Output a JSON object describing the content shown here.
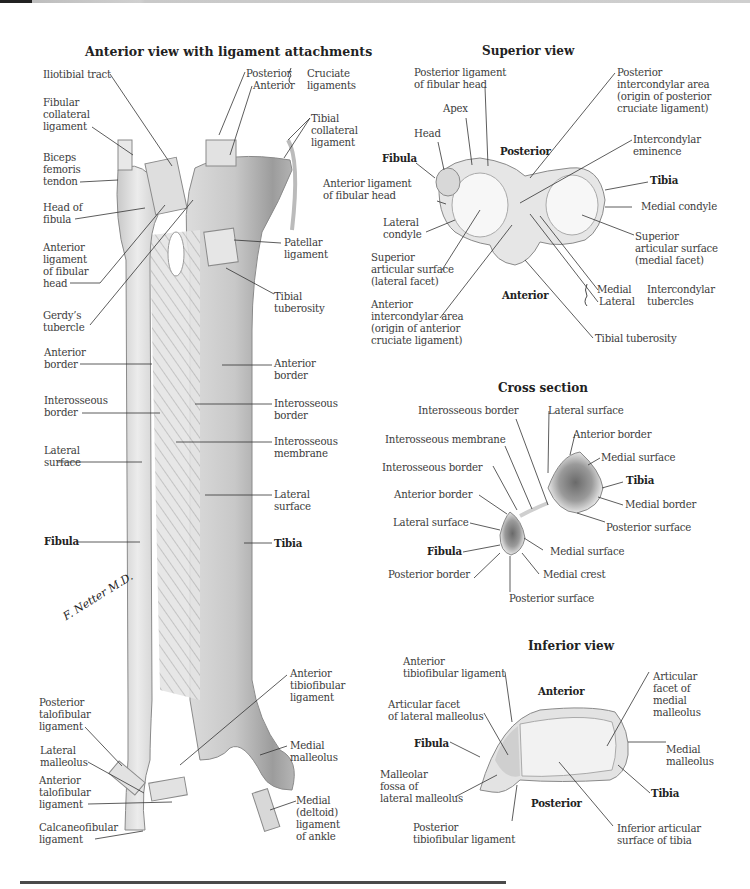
{
  "figure": {
    "signature": "F. Netter M.D.",
    "anterior_view": {
      "title": "Anterior view with ligament attachments",
      "labels": {
        "iliotibial_tract": "Iliotibial tract",
        "fibular_collateral_ligament": "Fibular\ncollateral\nligament",
        "biceps_femoris_tendon": "Biceps\nfemoris\ntendon",
        "head_of_fibula": "Head of\nfibula",
        "anterior_ligament_fibular_head": "Anterior\nligament\nof fibular\nhead",
        "gerdys_tubercle": "Gerdy’s\ntubercle",
        "fibula_anterior_border": "Anterior\nborder",
        "fibula_interosseous_border": "Interosseous\nborder",
        "fibula_lateral_surface": "Lateral\nsurface",
        "fibula": "Fibula",
        "posterior_talofibular_ligament": "Posterior\ntalofibular\nligament",
        "lateral_malleolus": "Lateral\nmalleolus",
        "anterior_talofibular_ligament": "Anterior\ntalofibular\nligament",
        "calcaneofibular_ligament": "Calcaneofibular\nligament",
        "cruciate_posterior": "Posterior",
        "cruciate_anterior": "Anterior",
        "cruciate_ligaments": "Cruciate\nligaments",
        "tibial_collateral_ligament": "Tibial\ncollateral\nligament",
        "patellar_ligament": "Patellar\nligament",
        "tibial_tuberosity": "Tibial\ntuberosity",
        "tibia_anterior_border": "Anterior\nborder",
        "tibia_interosseous_border": "Interosseous\nborder",
        "interosseous_membrane": "Interosseous\nmembrane",
        "tibia_lateral_surface": "Lateral\nsurface",
        "tibia": "Tibia",
        "anterior_tibiofibular_ligament": "Anterior\ntibiofibular\nligament",
        "medial_malleolus": "Medial\nmalleolus",
        "medial_deltoid_ligament": "Medial\n(deltoid)\nligament\nof ankle"
      }
    },
    "superior_view": {
      "title": "Superior view",
      "labels": {
        "posterior_ligament_fibular_head": "Posterior ligament\nof fibular head",
        "apex": "Apex",
        "head": "Head",
        "fibula": "Fibula",
        "anterior_ligament_fibular_head": "Anterior ligament\nof fibular head",
        "lateral_condyle": "Lateral\ncondyle",
        "superior_articular_lateral": "Superior\narticular surface\n(lateral facet)",
        "anterior_intercondylar_area": "Anterior\nintercondylar area\n(origin of anterior\ncruciate ligament)",
        "posterior": "Posterior",
        "anterior": "Anterior",
        "posterior_intercondylar_area": "Posterior\nintercondylar area\n(origin of posterior\ncruciate ligament)",
        "intercondylar_eminence": "Intercondylar\neminence",
        "tibia": "Tibia",
        "medial_condyle": "Medial condyle",
        "superior_articular_medial": "Superior\narticular surface\n(medial facet)",
        "tubercle_medial": "Medial",
        "tubercle_lateral": "Lateral",
        "intercondylar_tubercles": "Intercondylar\ntubercles",
        "tibial_tuberosity": "Tibial tuberosity"
      }
    },
    "cross_section": {
      "title": "Cross section",
      "labels": {
        "interosseous_border_tibia": "Interosseous border",
        "interosseous_membrane": "Interosseous membrane",
        "interosseous_border_fibula": "Interosseous border",
        "anterior_border_fibula": "Anterior border",
        "lateral_surface_fibula": "Lateral surface",
        "fibula": "Fibula",
        "posterior_border": "Posterior border",
        "posterior_surface_fibula": "Posterior surface",
        "medial_crest": "Medial crest",
        "medial_surface_fibula": "Medial surface",
        "lateral_surface_tibia": "Lateral surface",
        "anterior_border_tibia": "Anterior border",
        "medial_surface_tibia": "Medial surface",
        "tibia": "Tibia",
        "medial_border": "Medial border",
        "posterior_surface_tibia": "Posterior surface"
      }
    },
    "inferior_view": {
      "title": "Inferior view",
      "labels": {
        "anterior_tibiofibular_ligament": "Anterior\ntibiofibular ligament",
        "articular_facet_lateral_malleolus": "Articular facet\nof lateral malleolus",
        "fibula": "Fibula",
        "malleolar_fossa": "Malleolar\nfossa of\nlateral malleolus",
        "posterior_tibiofibular_ligament": "Posterior\ntibiofibular ligament",
        "anterior": "Anterior",
        "posterior": "Posterior",
        "articular_facet_medial_malleolus": "Articular\nfacet of\nmedial\nmalleolus",
        "medial_malleolus": "Medial\nmalleolus",
        "tibia": "Tibia",
        "inferior_articular_surface": "Inferior articular\nsurface of tibia"
      }
    }
  }
}
